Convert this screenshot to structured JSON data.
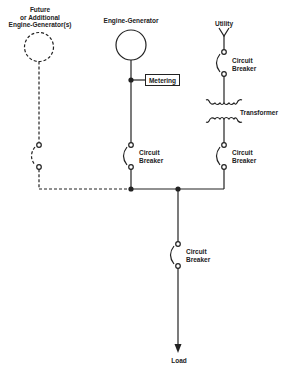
{
  "diagram": {
    "type": "one-line electrical diagram",
    "sources": {
      "future_generator": {
        "label_lines": [
          "Future",
          "or Additional",
          "Engine-Generator(s)"
        ],
        "style": "dashed"
      },
      "engine_generator": {
        "label": "Engine-Generator",
        "metering_label": "Metering"
      },
      "utility": {
        "label": "Utility",
        "transformer_label": "Transformer"
      }
    },
    "breakers": {
      "engine_generator": {
        "label_lines": [
          "Circuit",
          "Breaker"
        ]
      },
      "utility_upper": {
        "label_lines": [
          "Circuit",
          "Breaker"
        ]
      },
      "utility_lower": {
        "label_lines": [
          "Circuit",
          "Breaker"
        ]
      },
      "load": {
        "label_lines": [
          "Circuit",
          "Breaker"
        ]
      },
      "future": {
        "label_lines": []
      }
    },
    "load": {
      "label": "Load"
    },
    "colors": {
      "line": "#222222",
      "background": "#ffffff"
    }
  }
}
